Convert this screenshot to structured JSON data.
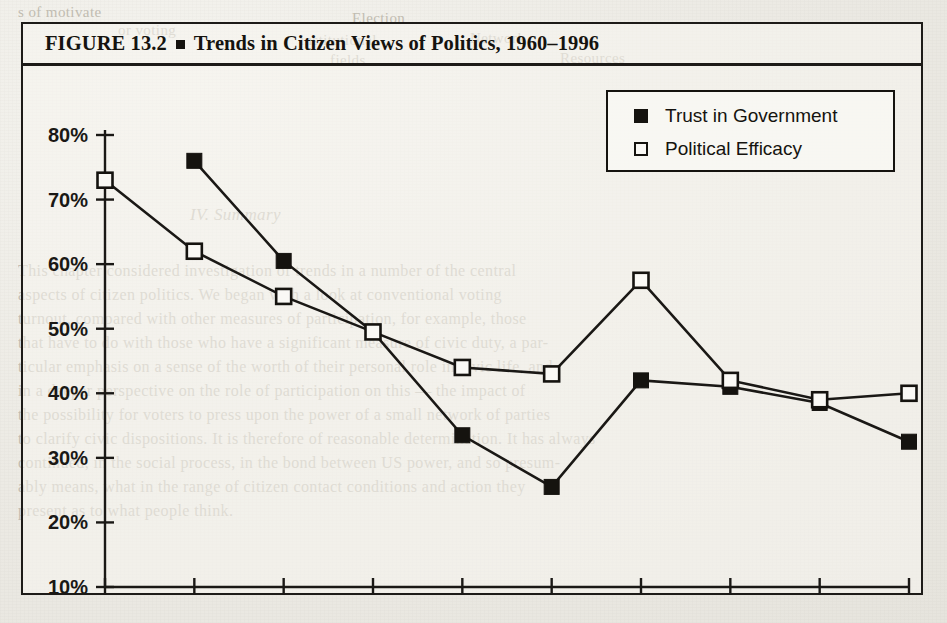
{
  "figure": {
    "caption_number": "FIGURE 13.2",
    "caption_separator": "square-bullet",
    "caption_title": "Trends in Citizen Views of Politics, 1960–1996"
  },
  "legend": {
    "position": "top-right",
    "entries": [
      {
        "label": "Trust in Government",
        "marker": "filled-square",
        "color": "#15130f"
      },
      {
        "label": "Political Efficacy",
        "marker": "open-square",
        "color": "#15130f"
      }
    ]
  },
  "chart_data": {
    "type": "line",
    "title": "Trends in Citizen Views of Politics, 1960–1996",
    "xlabel": "",
    "ylabel": "",
    "grid": false,
    "legend_position": "top-right",
    "categories": [
      1960,
      1964,
      1968,
      1972,
      1976,
      1980,
      1984,
      1988,
      1992,
      1996
    ],
    "x_tick_labels": [
      "1960",
      "1964",
      "1968",
      "1972",
      "1976",
      "1980",
      "1984",
      "1988",
      "1992",
      "1996"
    ],
    "y_tick_labels": [
      "10%",
      "20%",
      "30%",
      "40%",
      "50%",
      "60%",
      "70%",
      "80%"
    ],
    "y_ticks": [
      10,
      20,
      30,
      40,
      50,
      60,
      70,
      80
    ],
    "ylim": [
      10,
      80
    ],
    "xlim": [
      1960,
      1996
    ],
    "series": [
      {
        "name": "Trust in Government",
        "marker": "filled-square",
        "values": [
          null,
          76,
          60.5,
          49.5,
          33.5,
          25.5,
          42,
          41,
          38.5,
          32.5
        ]
      },
      {
        "name": "Political Efficacy",
        "marker": "open-square",
        "values": [
          73,
          62,
          55,
          49.5,
          44,
          43,
          57.5,
          42,
          39,
          40
        ]
      }
    ]
  },
  "background_text": {
    "note": "faint bleed-through text from reverse page",
    "lines": [
      {
        "text": "s of motivate",
        "x": 18,
        "y": 4,
        "size": 15,
        "italic": false
      },
      {
        "text": "or voting",
        "x": 118,
        "y": 22,
        "size": 15,
        "italic": false
      },
      {
        "text": "Election",
        "x": 352,
        "y": 10,
        "size": 15,
        "italic": false
      },
      {
        "text": "institutional",
        "x": 300,
        "y": 32,
        "size": 15,
        "italic": false
      },
      {
        "text": "Network",
        "x": 470,
        "y": 30,
        "size": 15,
        "italic": false
      },
      {
        "text": "fields",
        "x": 330,
        "y": 52,
        "size": 15,
        "italic": false
      },
      {
        "text": "Resources",
        "x": 560,
        "y": 50,
        "size": 15,
        "italic": false
      },
      {
        "text": "IV. Summary",
        "x": 190,
        "y": 205,
        "size": 17,
        "italic": true
      },
      {
        "text": "This chapter considered investigation of trends in a number of the central",
        "x": 18,
        "y": 262,
        "size": 16,
        "italic": false
      },
      {
        "text": "aspects of citizen politics. We began with a look at conventional voting",
        "x": 18,
        "y": 286,
        "size": 16,
        "italic": false
      },
      {
        "text": "turnout, compared with other measures of participation, for example, those",
        "x": 18,
        "y": 310,
        "size": 16,
        "italic": false
      },
      {
        "text": "that have to do with those who have a significant measure of civic duty, a par-",
        "x": 18,
        "y": 334,
        "size": 16,
        "italic": false
      },
      {
        "text": "ticular emphasis on a sense of the worth of their personal role in civic life, and",
        "x": 18,
        "y": 358,
        "size": 16,
        "italic": false
      },
      {
        "text": "in a deeper perspective on the role of participation on this — the impact of",
        "x": 18,
        "y": 382,
        "size": 16,
        "italic": false
      },
      {
        "text": "the possibility for voters to press upon the power of a small network of parties",
        "x": 18,
        "y": 406,
        "size": 16,
        "italic": false
      },
      {
        "text": "to clarify civic dispositions. It is therefore of reasonable determination. It has always",
        "x": 18,
        "y": 430,
        "size": 16,
        "italic": false
      },
      {
        "text": "continued, in the social process, in the bond between US power, and so presum-",
        "x": 18,
        "y": 454,
        "size": 16,
        "italic": false
      },
      {
        "text": "ably means, what in the range of citizen contact conditions and action they",
        "x": 18,
        "y": 478,
        "size": 16,
        "italic": false
      },
      {
        "text": "present as to what people think.",
        "x": 18,
        "y": 502,
        "size": 16,
        "italic": false
      }
    ]
  }
}
